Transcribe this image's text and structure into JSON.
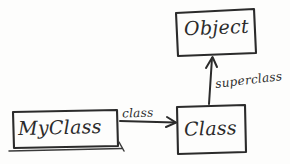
{
  "diagram": {
    "style": "hand-drawn-sketch",
    "ink_color": "#2b2b2b",
    "paper_color": "#fdfdfc",
    "nodes": [
      {
        "id": "myclass",
        "label": "MyClass",
        "shape": "rectangle"
      },
      {
        "id": "class",
        "label": "Class",
        "shape": "rectangle"
      },
      {
        "id": "object",
        "label": "Object",
        "shape": "rectangle"
      }
    ],
    "edges": [
      {
        "id": "edge-class",
        "label": "class",
        "from": "myclass",
        "to": "class",
        "direction": "right",
        "arrow": "open"
      },
      {
        "id": "edge-superclass",
        "label": "superclass",
        "from": "class",
        "to": "object",
        "direction": "up",
        "arrow": "open"
      }
    ]
  }
}
